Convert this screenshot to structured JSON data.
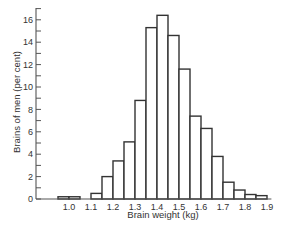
{
  "chart_data": {
    "type": "bar",
    "title": "",
    "xlabel": "Brain weight (kg)",
    "ylabel": "Brains of men  (per cent)",
    "xlim": [
      0.95,
      1.9
    ],
    "ylim": [
      0,
      17
    ],
    "x_ticks": [
      "1.0",
      "1.1",
      "1.2",
      "1.3",
      "1.4",
      "1.5",
      "1.6",
      "1.7",
      "1.8",
      "1.9"
    ],
    "y_ticks": [
      "0",
      "2",
      "4",
      "6",
      "8",
      "10",
      "12",
      "14",
      "16"
    ],
    "y_minor_tick_step": 1,
    "bin_width": 0.05,
    "grid": false,
    "legend": null,
    "bins": [
      {
        "start": 0.95,
        "end": 1.0,
        "value": 0.2
      },
      {
        "start": 1.0,
        "end": 1.05,
        "value": 0.2
      },
      {
        "start": 1.1,
        "end": 1.15,
        "value": 0.5
      },
      {
        "start": 1.15,
        "end": 1.2,
        "value": 2.0
      },
      {
        "start": 1.2,
        "end": 1.25,
        "value": 3.4
      },
      {
        "start": 1.25,
        "end": 1.3,
        "value": 5.1
      },
      {
        "start": 1.3,
        "end": 1.35,
        "value": 8.8
      },
      {
        "start": 1.35,
        "end": 1.4,
        "value": 15.3
      },
      {
        "start": 1.4,
        "end": 1.45,
        "value": 16.4
      },
      {
        "start": 1.45,
        "end": 1.5,
        "value": 14.6
      },
      {
        "start": 1.5,
        "end": 1.55,
        "value": 11.6
      },
      {
        "start": 1.55,
        "end": 1.6,
        "value": 7.4
      },
      {
        "start": 1.6,
        "end": 1.65,
        "value": 6.3
      },
      {
        "start": 1.65,
        "end": 1.7,
        "value": 3.8
      },
      {
        "start": 1.7,
        "end": 1.75,
        "value": 1.5
      },
      {
        "start": 1.75,
        "end": 1.8,
        "value": 0.8
      },
      {
        "start": 1.8,
        "end": 1.85,
        "value": 0.4
      },
      {
        "start": 1.85,
        "end": 1.9,
        "value": 0.3
      }
    ],
    "colors": {
      "bar_fill": "#ffffff",
      "bar_stroke": "#333333",
      "axis": "#555555"
    }
  }
}
